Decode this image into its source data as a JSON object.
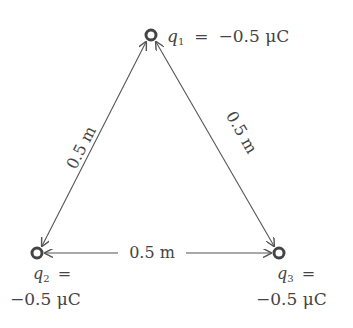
{
  "charges": [
    {
      "id": "q1",
      "symbol": "q",
      "subscript": "1",
      "equals": "=",
      "value": "−0.5 μC"
    },
    {
      "id": "q2",
      "symbol": "q",
      "subscript": "2",
      "equals": "=",
      "value": "−0.5 μC"
    },
    {
      "id": "q3",
      "symbol": "q",
      "subscript": "3",
      "equals": "=",
      "value": "−0.5 μC"
    }
  ],
  "distances": {
    "q1_q2": "0.5 m",
    "q1_q3": "0.5 m",
    "q2_q3": "0.5 m"
  },
  "colors": {
    "line": "#555555",
    "text": "#444444",
    "charge": "#444444"
  }
}
